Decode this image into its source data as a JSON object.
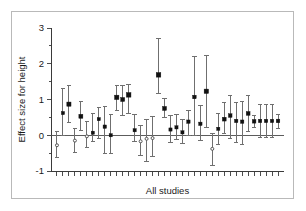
{
  "figure": {
    "background_color": "#ffffff",
    "frame_color": "#b9b9b9",
    "axis_color": "#3a3a3a",
    "marker_fill_color": "#111111",
    "marker_open_color": "#ffffff",
    "ci_color": "#6f6f6f"
  },
  "chart_data": {
    "type": "scatter",
    "title": "",
    "subtitle": "",
    "xlabel": "All studies",
    "ylabel": "Effect size for height",
    "ylim": [
      -1,
      3
    ],
    "yticks": [
      -1,
      0,
      1,
      2,
      3
    ],
    "ytick_labels": [
      "-1",
      "0",
      "1",
      "2",
      "3"
    ],
    "xlim": [
      0,
      39
    ],
    "xticks_count": 38,
    "xtick_labels": [],
    "grid": false,
    "legend": "none",
    "zero_reference_line": 0,
    "annotations": [],
    "series": [
      {
        "name": "Study effect sizes with 95% confidence intervals",
        "point_labels": [
          "study-1",
          "study-2",
          "study-3",
          "study-4",
          "study-5",
          "study-6",
          "study-7",
          "study-8",
          "study-9",
          "study-10",
          "study-11",
          "study-12",
          "study-13",
          "study-14",
          "study-15",
          "study-16",
          "study-17",
          "study-18",
          "study-19",
          "study-20",
          "study-21",
          "study-22",
          "study-23",
          "study-24",
          "study-25",
          "study-26",
          "study-27",
          "study-28",
          "study-29",
          "study-30",
          "study-31",
          "study-32",
          "study-33",
          "study-34",
          "study-35",
          "study-36",
          "study-37",
          "study-38"
        ],
        "x": [
          1,
          2,
          3,
          4,
          5,
          6,
          7,
          8,
          9,
          10,
          11,
          12,
          13,
          14,
          15,
          16,
          17,
          18,
          19,
          20,
          21,
          22,
          23,
          24,
          25,
          26,
          27,
          28,
          29,
          30,
          31,
          32,
          33,
          34,
          35,
          36,
          37,
          38
        ],
        "values": [
          -0.28,
          0.62,
          0.87,
          -0.15,
          0.53,
          -0.03,
          0.07,
          0.45,
          0.24,
          0.0,
          1.06,
          1.0,
          1.13,
          0.14,
          -0.17,
          -0.1,
          -0.08,
          1.69,
          0.75,
          0.16,
          0.22,
          0.08,
          0.38,
          1.07,
          0.32,
          1.23,
          -0.38,
          0.18,
          0.45,
          0.55,
          0.4,
          0.38,
          0.61,
          0.39,
          0.4,
          0.4,
          0.4,
          0.4
        ],
        "ci_low": [
          -0.62,
          0.0,
          0.37,
          -0.47,
          0.14,
          -0.33,
          -0.18,
          -0.08,
          -0.5,
          -0.5,
          0.7,
          0.55,
          0.62,
          -0.18,
          -0.56,
          -0.73,
          -0.6,
          1.17,
          0.5,
          -0.2,
          -0.12,
          -0.22,
          -0.02,
          0.0,
          -0.16,
          0.22,
          -0.84,
          -0.26,
          0.06,
          -0.1,
          -0.2,
          -0.25,
          0.1,
          0.22,
          -0.05,
          -0.05,
          -0.05,
          0.2
        ],
        "ci_high": [
          0.1,
          1.3,
          1.38,
          0.18,
          0.95,
          0.38,
          0.62,
          0.78,
          0.8,
          0.58,
          1.38,
          1.4,
          1.42,
          0.58,
          0.28,
          0.45,
          0.52,
          2.72,
          1.02,
          0.55,
          0.58,
          0.45,
          0.7,
          2.2,
          0.82,
          2.23,
          0.05,
          0.6,
          0.92,
          1.12,
          0.92,
          0.95,
          1.12,
          0.55,
          0.85,
          0.85,
          0.85,
          0.58
        ],
        "marker_types": [
          "open",
          "filled",
          "filled",
          "open",
          "filled",
          "open",
          "filled",
          "filled",
          "filled",
          "filled",
          "filled",
          "filled",
          "filled",
          "filled",
          "open",
          "open",
          "open",
          "filled",
          "filled",
          "filled",
          "filled",
          "filled",
          "filled",
          "filled",
          "filled",
          "filled",
          "open",
          "filled",
          "filled",
          "filled",
          "filled",
          "filled",
          "filled",
          "filled",
          "filled",
          "filled",
          "filled",
          "filled"
        ],
        "marker_sizes": [
          3.0,
          3.2,
          4.2,
          3.0,
          4.0,
          3.0,
          3.2,
          3.2,
          3.4,
          3.2,
          4.4,
          4.0,
          4.6,
          3.2,
          3.0,
          3.0,
          3.0,
          4.6,
          4.0,
          3.2,
          3.2,
          3.2,
          3.4,
          3.6,
          3.4,
          4.4,
          3.0,
          3.2,
          3.8,
          3.6,
          3.4,
          3.4,
          3.8,
          3.6,
          3.4,
          3.4,
          3.4,
          3.6
        ]
      }
    ]
  }
}
